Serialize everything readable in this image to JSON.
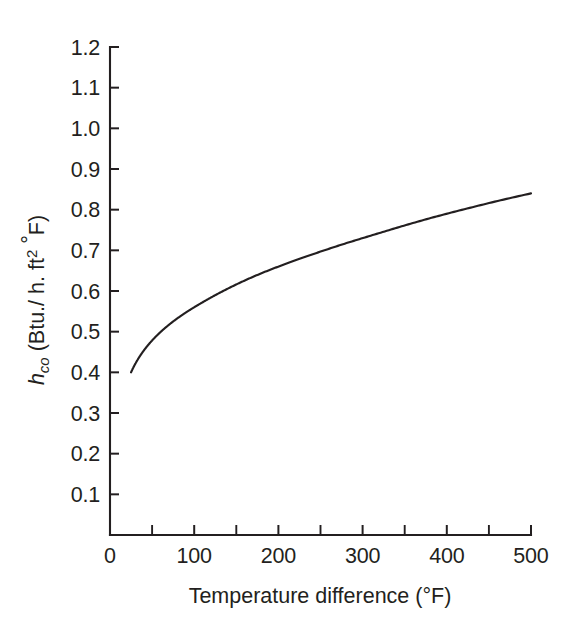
{
  "chart_data": {
    "type": "line",
    "title": "",
    "subtitle": "",
    "xlabel": "Temperature difference (°F)",
    "ylabel": "h_co (Btu./ h. ft² °F)",
    "ylabel_parts": {
      "symbol": "h",
      "subscript": "co",
      "units_open": " (Btu./ h. ft",
      "units_exponent": "2",
      "units_degree": "°",
      "units_close": "F)"
    },
    "xlim": [
      0,
      500
    ],
    "ylim": [
      0,
      1.2
    ],
    "grid": false,
    "legend": false,
    "legend_position": "none",
    "x_tick_labels": [
      "0",
      "100",
      "200",
      "300",
      "400",
      "500"
    ],
    "x_tick_values": [
      0,
      100,
      200,
      300,
      400,
      500
    ],
    "x_minor_tick_values": [
      50,
      150,
      250,
      350,
      450
    ],
    "y_tick_labels": [
      "0.1",
      "0.2",
      "0.3",
      "0.4",
      "0.5",
      "0.6",
      "0.7",
      "0.8",
      "0.9",
      "1.0",
      "1.1",
      "1.2"
    ],
    "y_tick_values": [
      0.1,
      0.2,
      0.3,
      0.4,
      0.5,
      0.6,
      0.7,
      0.8,
      0.9,
      1.0,
      1.1,
      1.2
    ],
    "series": [
      {
        "name": "h_co",
        "x": [
          25,
          30,
          40,
          50,
          60,
          75,
          100,
          125,
          150,
          175,
          200,
          225,
          250,
          275,
          300,
          325,
          350,
          375,
          400,
          425,
          450,
          475,
          500
        ],
        "values": [
          0.4,
          0.414,
          0.438,
          0.456,
          0.471,
          0.49,
          0.516,
          0.537,
          0.554,
          0.57,
          0.583,
          0.596,
          0.607,
          0.617,
          0.627,
          0.636,
          0.644,
          0.652,
          0.66,
          0.667,
          0.674,
          0.68,
          0.687
        ]
      }
    ],
    "curve_reference_points": [
      {
        "x": 25,
        "y": 0.4
      },
      {
        "x": 100,
        "y": 0.56
      },
      {
        "x": 200,
        "y": 0.66
      },
      {
        "x": 300,
        "y": 0.73
      },
      {
        "x": 400,
        "y": 0.79
      },
      {
        "x": 500,
        "y": 0.84
      }
    ],
    "colors": {
      "curve": "#231f20",
      "axis": "#231f20",
      "background": "#ffffff",
      "text": "#231f20"
    }
  },
  "figure": {
    "background_color": "#ffffff",
    "width": 571,
    "height": 631
  }
}
